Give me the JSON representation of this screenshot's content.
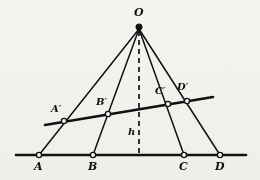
{
  "figure": {
    "background_color": "#f8f8f6",
    "ink_color": "#111111",
    "width": 260,
    "height": 180
  },
  "apex": {
    "name": "O",
    "label": "O",
    "x": 139,
    "y": 27,
    "label_x": 134,
    "label_y": 8
  },
  "baseline": {
    "name": "base-line",
    "x1": 16,
    "y1": 155,
    "x2": 246,
    "y2": 155,
    "stroke_width": 2.4
  },
  "transversal": {
    "name": "transversal-line",
    "x1": 45,
    "y1": 125,
    "x2": 213,
    "y2": 97,
    "stroke_width": 2.4
  },
  "altitude": {
    "name": "altitude",
    "label": "h",
    "x": 139,
    "y_top": 30,
    "y_bottom": 155,
    "dash": "5,4",
    "label_x": 128,
    "label_y": 128
  },
  "base_points": [
    {
      "id": "A",
      "label": "A",
      "x": 39,
      "y": 155,
      "label_x": 34,
      "label_y": 162
    },
    {
      "id": "B",
      "label": "B",
      "x": 93,
      "y": 155,
      "label_x": 88,
      "label_y": 162
    },
    {
      "id": "C",
      "label": "C",
      "x": 184,
      "y": 155,
      "label_x": 179,
      "label_y": 162
    },
    {
      "id": "D",
      "label": "D",
      "x": 220,
      "y": 155,
      "label_x": 215,
      "label_y": 162
    }
  ],
  "transversal_points": [
    {
      "id": "A-prime",
      "label": "A′",
      "x": 64,
      "y": 121,
      "label_x": 52,
      "label_y": 107
    },
    {
      "id": "B-prime",
      "label": "B′",
      "x": 108,
      "y": 114,
      "label_x": 97,
      "label_y": 100
    },
    {
      "id": "C-prime",
      "label": "C′",
      "x": 168,
      "y": 104,
      "label_x": 156,
      "label_y": 89
    },
    {
      "id": "D-prime",
      "label": "D′",
      "x": 187,
      "y": 101,
      "label_x": 178,
      "label_y": 85
    }
  ],
  "rays": [
    {
      "name": "ray-O-A",
      "to": "A",
      "x2": 39,
      "y2": 155
    },
    {
      "name": "ray-O-B",
      "to": "B",
      "x2": 93,
      "y2": 155
    },
    {
      "name": "ray-O-C",
      "to": "C",
      "x2": 184,
      "y2": 155
    },
    {
      "name": "ray-O-D",
      "to": "D",
      "x2": 220,
      "y2": 155
    }
  ]
}
